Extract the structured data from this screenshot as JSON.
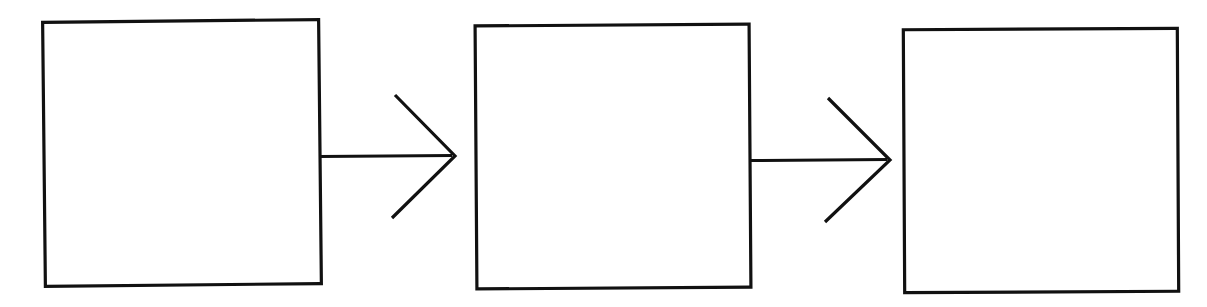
{
  "diagram": {
    "title": "",
    "type": "flowchart",
    "orientation": "left-to-right",
    "style": "hand-drawn scanned line art",
    "canvas": {
      "width": 1207,
      "height": 307
    },
    "colors": {
      "background": "#ffffff",
      "stroke": "#111111",
      "node_fill": "#ffffff"
    },
    "nodes": [
      {
        "id": "node-1",
        "name": "stage-one-box",
        "label": "",
        "shape": "rectangle",
        "x": 44,
        "y": 21,
        "width": 276,
        "height": 264,
        "stroke_width": 3.2,
        "rotation_deg": -0.6
      },
      {
        "id": "node-2",
        "name": "stage-two-box",
        "label": "",
        "shape": "rectangle",
        "x": 476,
        "y": 25,
        "width": 274,
        "height": 263,
        "stroke_width": 3.2,
        "rotation_deg": -0.4
      },
      {
        "id": "node-3",
        "name": "stage-three-box",
        "label": "",
        "shape": "rectangle",
        "x": 904,
        "y": 29,
        "width": 274,
        "height": 263,
        "stroke_width": 3.2,
        "rotation_deg": -0.3
      }
    ],
    "edges": [
      {
        "id": "edge-1",
        "name": "arrow-stage-one-to-stage-two",
        "label": "",
        "from": "node-1",
        "to": "node-2",
        "shaft_start_x": 320,
        "shaft_start_y": 156,
        "tip_x": 455,
        "tip_y": 156,
        "head_upper_x": 395,
        "head_upper_y": 95,
        "head_lower_x": 392,
        "head_lower_y": 218,
        "stroke_width": 3.0
      },
      {
        "id": "edge-2",
        "name": "arrow-stage-two-to-stage-three",
        "label": "",
        "from": "node-2",
        "to": "node-3",
        "shaft_start_x": 750,
        "shaft_start_y": 160,
        "tip_x": 890,
        "tip_y": 160,
        "head_upper_x": 828,
        "head_upper_y": 98,
        "head_lower_x": 825,
        "head_lower_y": 222,
        "stroke_width": 3.0
      }
    ]
  }
}
